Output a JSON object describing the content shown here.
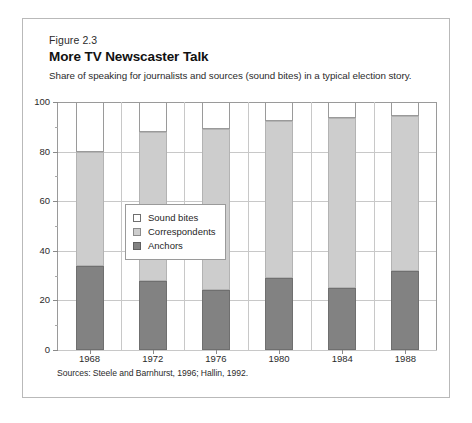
{
  "figure": {
    "number": "Figure 2.3",
    "title": "More TV Newscaster Talk",
    "subtitle": "Share of speaking for journalists and sources (sound bites) in a typical election story.",
    "source": "Sources: Steele and Barnhurst, 1996; Hallin, 1992."
  },
  "legend": {
    "position": "inside-plot-left-center",
    "entries": [
      {
        "label": "Sound bites",
        "color": "#ffffff",
        "swatch": "sw-soundbites"
      },
      {
        "label": "Correspondents",
        "color": "#cdcdcd",
        "swatch": "sw-correspondents"
      },
      {
        "label": "Anchors",
        "color": "#828282",
        "swatch": "sw-anchors"
      }
    ]
  },
  "chart_data": {
    "type": "bar",
    "subtype": "stacked-vertical",
    "title": "More TV Newscaster Talk",
    "subtitle": "Share of speaking for journalists and sources (sound bites) in a typical election story.",
    "xlabel": "",
    "ylabel": "",
    "categories": [
      "1968",
      "1972",
      "1976",
      "1980",
      "1984",
      "1988"
    ],
    "series": [
      {
        "name": "Anchors",
        "color": "#828282",
        "values": [
          34,
          28,
          24,
          29,
          25,
          32
        ]
      },
      {
        "name": "Correspondents",
        "color": "#cdcdcd",
        "values": [
          46,
          60,
          65,
          63.5,
          68.5,
          62.5
        ]
      },
      {
        "name": "Sound bites",
        "color": "#ffffff",
        "values": [
          20,
          12,
          11,
          7.5,
          6.5,
          5.5
        ]
      }
    ],
    "cumulative_tops": {
      "anchors": [
        34,
        28,
        24,
        29,
        25,
        32
      ],
      "anchors_plus_correspondents": [
        80,
        88,
        89,
        92.5,
        93.5,
        94.5
      ],
      "total": [
        100,
        100,
        100,
        100,
        100,
        100
      ]
    },
    "ylim": [
      0,
      100
    ],
    "yticks": [
      0,
      20,
      40,
      60,
      80,
      100
    ],
    "ytick_labels": [
      "0",
      "20",
      "40",
      "60",
      "80",
      "100"
    ],
    "yminor_ticks": [
      10,
      30,
      50,
      70,
      90
    ],
    "grid": "horizontal-and-vertical",
    "units": "percent"
  }
}
